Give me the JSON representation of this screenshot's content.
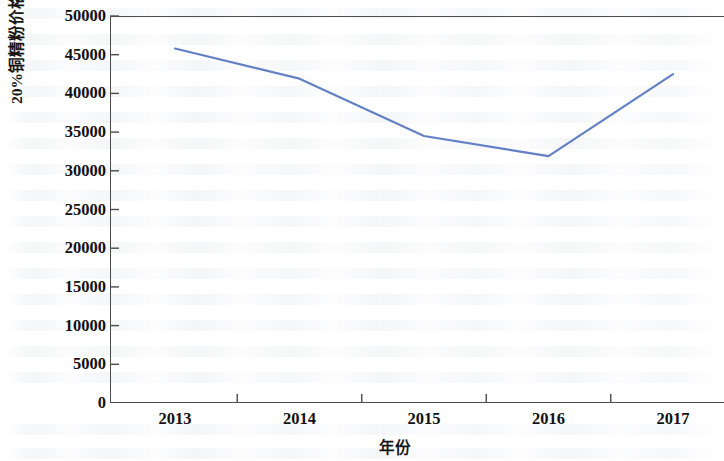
{
  "chart_data": {
    "type": "line",
    "title": "",
    "xlabel": "年份",
    "ylabel": "20%铜精粉价格/元·t",
    "ylabel_exponent": "-1",
    "categories": [
      "2013",
      "2014",
      "2015",
      "2016",
      "2017"
    ],
    "x": [
      2013,
      2014,
      2015,
      2016,
      2017
    ],
    "series": [
      {
        "name": "20%铜精粉价格",
        "values": [
          45800,
          41900,
          34500,
          31900,
          42500
        ],
        "color": "#6380c4"
      }
    ],
    "ylim": [
      0,
      50000
    ],
    "yticks": [
      0,
      5000,
      10000,
      15000,
      20000,
      25000,
      30000,
      35000,
      40000,
      45000,
      50000
    ],
    "ytick_labels": [
      "0",
      "5000",
      "10000",
      "15000",
      "20000",
      "25000",
      "30000",
      "35000",
      "40000",
      "45000",
      "50000"
    ],
    "xtick_labels": [
      "2013",
      "2014",
      "2015",
      "2016",
      "2017"
    ],
    "grid": false,
    "legend": null,
    "legend_position": "none",
    "axis_color": "#4c4c4c",
    "line_width": 2.2
  },
  "figure": {
    "y_axis_title_text": "20%铜精粉价格/元·t",
    "y_axis_title_sup": "-1",
    "x_axis_title_text": "年份"
  }
}
